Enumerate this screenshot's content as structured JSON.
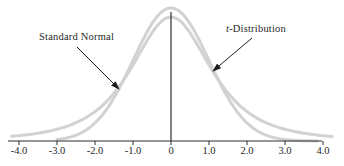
{
  "figure": {
    "labels": {
      "standard_normal": "Standard Normal",
      "t_prefix": "t",
      "t_suffix": "-Distribution"
    }
  },
  "chart_data": {
    "type": "line",
    "title": "",
    "xlabel": "",
    "ylabel": "",
    "xlim": [
      -4.2,
      4.2
    ],
    "grid": false,
    "legend_position": "arrow-annotations",
    "x_tick_labels": [
      "-4.0",
      "-3.0",
      "-2.0",
      "-1.0",
      "0",
      "1.0",
      "2.0",
      "3.0",
      "4.0"
    ],
    "x_tick_values": [
      -4,
      -3,
      -2,
      -1,
      0,
      1,
      2,
      3,
      4
    ],
    "curve_color": "#d3d2d0",
    "axis_color": "#2e2e2e",
    "arrow_color": "#1c1c1c",
    "series": [
      {
        "name": "Standard Normal",
        "shape": "normal-pdf",
        "peak_density": 0.399,
        "x_range": [
          -3.0,
          3.85
        ],
        "sample_x": [
          -3,
          -2,
          -1,
          0,
          1,
          2,
          3
        ],
        "sample_density": [
          0.004,
          0.054,
          0.242,
          0.399,
          0.242,
          0.054,
          0.004
        ]
      },
      {
        "name": "t-Distribution",
        "shape": "t-pdf",
        "df": 3,
        "peak_density": 0.372,
        "heavier_tails": true,
        "x_range": [
          -4.2,
          4.24
        ],
        "sample_x": [
          -4,
          -3,
          -2,
          -1,
          0,
          1,
          2,
          3,
          4
        ],
        "sample_density": [
          0.012,
          0.035,
          0.088,
          0.228,
          0.372,
          0.228,
          0.088,
          0.035,
          0.012
        ]
      }
    ],
    "render": {
      "x0_px": 171,
      "px_per_unit": 38,
      "axis_y_px": 141,
      "normal_peak_px": 133,
      "t_peak_px": 124,
      "t_tail_exponent": 1.7,
      "t_scale_k": 3,
      "axis_x_start_px": 8,
      "axis_x_end_px": 322,
      "tick_len_px": 4,
      "center_line_top_px": 12,
      "sn_arrow": [
        77,
        47,
        119,
        89
      ],
      "t_arrow": [
        252,
        38,
        213,
        71
      ]
    }
  }
}
